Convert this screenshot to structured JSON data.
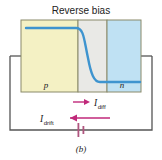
{
  "figure": {
    "title": "Reverse bias",
    "caption": "(b)",
    "regions": [
      {
        "id": "p-region",
        "label": "p",
        "color": "#f4f1c4"
      },
      {
        "id": "depletion-region",
        "label": "",
        "color": "#e9e9e6"
      },
      {
        "id": "n-region",
        "label": "n",
        "color": "#bfe1f3"
      }
    ],
    "band_curve": {
      "color": "#3e94cf",
      "description": "energy band edge falling from p side to n side"
    },
    "currents": [
      {
        "id": "diffusion-current",
        "label": "I",
        "subscript": "diff",
        "arrow_direction": "right",
        "color": "#c0297a"
      },
      {
        "id": "drift-current",
        "label": "I",
        "subscript": "drift",
        "arrow_direction": "left",
        "color": "#c0297a"
      }
    ],
    "circuit": {
      "wire_color": "#555555",
      "battery": {
        "id": "battery-symbol",
        "color": "#b0557f"
      }
    },
    "colors": {
      "p_fill": "#f4f1c4",
      "depletion_fill": "#e9e9e6",
      "n_fill": "#bfe1f3",
      "curve": "#3e94cf",
      "arrow": "#c0297a",
      "border": "#8a8a6a",
      "wire": "#555555"
    }
  }
}
